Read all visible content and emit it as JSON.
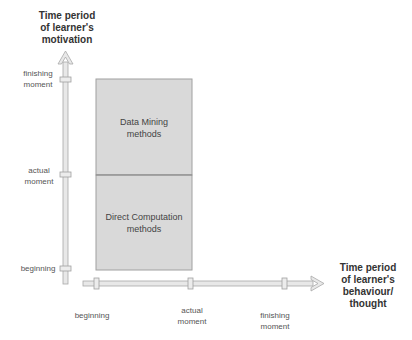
{
  "diagram": {
    "y_axis": {
      "title_lines": [
        "Time period",
        "of learner's",
        "motivation"
      ],
      "ticks": [
        {
          "lines": [
            "finishing",
            "moment"
          ]
        },
        {
          "lines": [
            "actual",
            "moment"
          ]
        },
        {
          "lines": [
            "beginning"
          ]
        }
      ]
    },
    "x_axis": {
      "title_lines": [
        "Time period",
        "of learner's",
        "behaviour/",
        "thought"
      ],
      "ticks": [
        {
          "lines": [
            "beginning"
          ]
        },
        {
          "lines": [
            "actual",
            "moment"
          ]
        },
        {
          "lines": [
            "finishing",
            "moment"
          ]
        }
      ]
    },
    "regions": [
      {
        "lines": [
          "Data Mining",
          "methods"
        ]
      },
      {
        "lines": [
          "Direct Computation",
          "methods"
        ]
      }
    ],
    "colors": {
      "box_fill": "#d9d9d9",
      "box_stroke": "#9a9a9a",
      "axis_fill": "#e6e6e6",
      "axis_stroke": "#a8a8a8"
    }
  }
}
